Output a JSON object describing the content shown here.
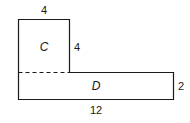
{
  "diagram": {
    "type": "composite-shape",
    "colors": {
      "stroke": "#1a1a1a",
      "fill": "#ffffff"
    },
    "regions": [
      {
        "id": "C",
        "label": "C",
        "shape": "square",
        "width": 4,
        "height": 4
      },
      {
        "id": "D",
        "label": "D",
        "shape": "rectangle",
        "width": 12,
        "height": 2
      }
    ],
    "dimensions": {
      "top_width": "4",
      "square_side": "4",
      "rect_height": "2",
      "bottom_width": "12"
    },
    "divider": {
      "style": "dashed",
      "between": [
        "C",
        "D"
      ]
    }
  }
}
